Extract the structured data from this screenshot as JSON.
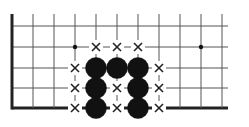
{
  "diagram": {
    "type": "go-board-fragment",
    "colors": {
      "line": "#555555",
      "edge": "#222222",
      "stone": "#111111",
      "mark": "#222222",
      "background": "#ffffff"
    },
    "grid": {
      "columns_x": [
        12,
        33,
        54,
        75,
        96,
        117,
        138,
        159,
        180,
        201,
        222
      ],
      "rows_y": [
        26,
        47,
        68,
        88,
        108
      ],
      "right_extent": 228,
      "top_extent": 14
    },
    "edges": [
      "left",
      "bottom"
    ],
    "star_points": [
      {
        "col": 3,
        "row": 1
      },
      {
        "col": 9,
        "row": 1
      }
    ],
    "stones": [
      {
        "color": "black",
        "col": 4,
        "row": 2
      },
      {
        "color": "black",
        "col": 5,
        "row": 2
      },
      {
        "color": "black",
        "col": 6,
        "row": 2
      },
      {
        "color": "black",
        "col": 4,
        "row": 3
      },
      {
        "color": "black",
        "col": 6,
        "row": 3
      },
      {
        "color": "black",
        "col": 4,
        "row": 4
      },
      {
        "color": "black",
        "col": 6,
        "row": 4
      }
    ],
    "marks": [
      {
        "symbol": "×",
        "col": 4,
        "row": 1
      },
      {
        "symbol": "×",
        "col": 5,
        "row": 1
      },
      {
        "symbol": "×",
        "col": 6,
        "row": 1
      },
      {
        "symbol": "×",
        "col": 3,
        "row": 2
      },
      {
        "symbol": "×",
        "col": 7,
        "row": 2
      },
      {
        "symbol": "×",
        "col": 3,
        "row": 3
      },
      {
        "symbol": "×",
        "col": 5,
        "row": 3
      },
      {
        "symbol": "×",
        "col": 7,
        "row": 3
      },
      {
        "symbol": "×",
        "col": 3,
        "row": 4
      },
      {
        "symbol": "×",
        "col": 5,
        "row": 4
      },
      {
        "symbol": "×",
        "col": 7,
        "row": 4
      }
    ]
  }
}
